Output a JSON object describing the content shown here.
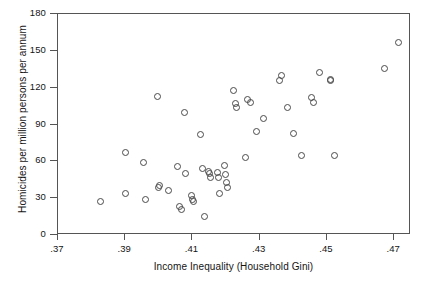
{
  "chart_data": {
    "type": "scatter",
    "title": "",
    "xlabel": "Income Inequality (Household Gini)",
    "ylabel": "Homicides per million persons per annum",
    "xlim": [
      0.37,
      0.475
    ],
    "ylim": [
      0,
      180
    ],
    "xticks": [
      0.37,
      0.39,
      0.41,
      0.43,
      0.45,
      0.47
    ],
    "xtick_labels": [
      ".37",
      ".39",
      ".41",
      ".43",
      ".45",
      ".47"
    ],
    "yticks": [
      0,
      30,
      60,
      90,
      120,
      150,
      180
    ],
    "ytick_labels": [
      "0",
      "30",
      "60",
      "90",
      "120",
      "150",
      "180"
    ],
    "grid": false,
    "legend": false,
    "marker": "open-circle",
    "marker_color": "#4a4a4a",
    "n_points": 51,
    "points": [
      {
        "x": 0.3825,
        "y": 27
      },
      {
        "x": 0.39,
        "y": 67
      },
      {
        "x": 0.39,
        "y": 34
      },
      {
        "x": 0.3955,
        "y": 59
      },
      {
        "x": 0.396,
        "y": 29
      },
      {
        "x": 0.3995,
        "y": 113
      },
      {
        "x": 0.4,
        "y": 39
      },
      {
        "x": 0.4003,
        "y": 40
      },
      {
        "x": 0.403,
        "y": 36
      },
      {
        "x": 0.4055,
        "y": 56
      },
      {
        "x": 0.406,
        "y": 23
      },
      {
        "x": 0.4068,
        "y": 21
      },
      {
        "x": 0.4075,
        "y": 100
      },
      {
        "x": 0.408,
        "y": 50
      },
      {
        "x": 0.4098,
        "y": 32
      },
      {
        "x": 0.41,
        "y": 29
      },
      {
        "x": 0.4103,
        "y": 27
      },
      {
        "x": 0.4125,
        "y": 82
      },
      {
        "x": 0.413,
        "y": 54
      },
      {
        "x": 0.4135,
        "y": 15
      },
      {
        "x": 0.4148,
        "y": 52
      },
      {
        "x": 0.4152,
        "y": 50
      },
      {
        "x": 0.4155,
        "y": 47
      },
      {
        "x": 0.4175,
        "y": 51
      },
      {
        "x": 0.4178,
        "y": 47
      },
      {
        "x": 0.418,
        "y": 34
      },
      {
        "x": 0.4195,
        "y": 57
      },
      {
        "x": 0.4198,
        "y": 49
      },
      {
        "x": 0.42,
        "y": 43
      },
      {
        "x": 0.4203,
        "y": 39
      },
      {
        "x": 0.4222,
        "y": 118
      },
      {
        "x": 0.4228,
        "y": 107
      },
      {
        "x": 0.423,
        "y": 104
      },
      {
        "x": 0.4258,
        "y": 63
      },
      {
        "x": 0.4265,
        "y": 110
      },
      {
        "x": 0.4272,
        "y": 108
      },
      {
        "x": 0.429,
        "y": 84
      },
      {
        "x": 0.431,
        "y": 95
      },
      {
        "x": 0.436,
        "y": 126
      },
      {
        "x": 0.4365,
        "y": 130
      },
      {
        "x": 0.4382,
        "y": 104
      },
      {
        "x": 0.44,
        "y": 83
      },
      {
        "x": 0.4425,
        "y": 65
      },
      {
        "x": 0.4455,
        "y": 112
      },
      {
        "x": 0.446,
        "y": 108
      },
      {
        "x": 0.4478,
        "y": 132
      },
      {
        "x": 0.451,
        "y": 127
      },
      {
        "x": 0.4512,
        "y": 126
      },
      {
        "x": 0.4522,
        "y": 65
      },
      {
        "x": 0.4672,
        "y": 136
      },
      {
        "x": 0.4712,
        "y": 157
      }
    ]
  }
}
